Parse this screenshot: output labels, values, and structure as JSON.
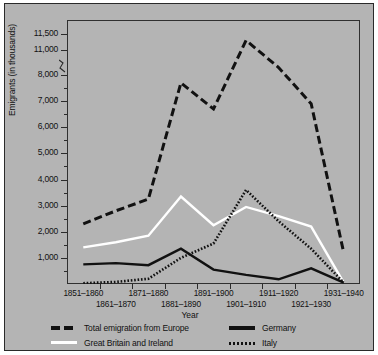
{
  "chart_data": {
    "type": "line",
    "title": "",
    "xlabel": "Year",
    "ylabel": "Emigrants (in thousands)",
    "grid": false,
    "legend_position": "bottom",
    "axis_break": {
      "from": 8000,
      "to": 11000,
      "note": "y-axis broken between 8,000 and 11,000"
    },
    "ylim": [
      0,
      11500
    ],
    "ytick_labels": [
      "11,500",
      "11,000",
      "8,000",
      "7,000",
      "6,000",
      "5,000",
      "4,000",
      "3,000",
      "2,000",
      "1,000"
    ],
    "ytick_values": [
      11500,
      11000,
      8000,
      7000,
      6000,
      5000,
      4000,
      3000,
      2000,
      1000
    ],
    "categories": [
      "1851–1860",
      "1861–1870",
      "1871–1880",
      "1881–1890",
      "1891–1900",
      "1901–1910",
      "1911–1920",
      "1921–1930",
      "1931–1940"
    ],
    "series": [
      {
        "name": "Total emigration from Europe",
        "style": "dashed",
        "color": "#111111",
        "values": [
          2300,
          2800,
          3250,
          7700,
          6700,
          11300,
          8900,
          6900,
          1200
        ]
      },
      {
        "name": "Great Britain and Ireland",
        "style": "solid",
        "color": "#ffffff",
        "values": [
          1400,
          1600,
          1850,
          3350,
          2250,
          2950,
          2600,
          2200,
          50
        ]
      },
      {
        "name": "Germany",
        "style": "solid",
        "color": "#111111",
        "values": [
          750,
          800,
          720,
          1350,
          550,
          350,
          180,
          600,
          50
        ]
      },
      {
        "name": "Italy",
        "style": "dotted",
        "color": "#111111",
        "values": [
          30,
          80,
          200,
          1000,
          1550,
          3600,
          2400,
          1350,
          50
        ]
      }
    ]
  },
  "legend": {
    "items": [
      {
        "label": "Total emigration from Europe"
      },
      {
        "label": "Great Britain and Ireland"
      },
      {
        "label": "Germany"
      },
      {
        "label": "Italy"
      }
    ]
  },
  "colors": {
    "figure_background": "#b4b4b4",
    "axis": "#2b2b2b",
    "text": "#111111",
    "white_series": "#ffffff"
  }
}
